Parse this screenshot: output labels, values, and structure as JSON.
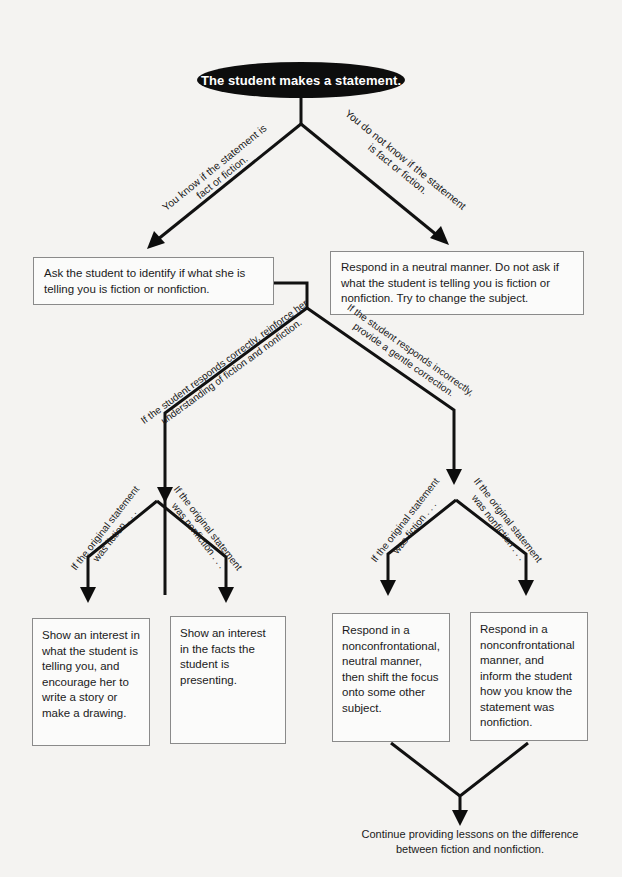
{
  "diagram": {
    "start": "The student makes a statement.",
    "branch_know": {
      "label_line1": "You know if the statement is",
      "label_line2": "fact or fiction."
    },
    "branch_not_know": {
      "label_line1": "You do not know if the statement",
      "label_line2": "is fact or fiction."
    },
    "box_ask": "Ask the student to identify if what she is telling you is fiction or nonfiction.",
    "box_neutral": "Respond in a neutral manner. Do not ask if what the student is telling you is fiction or nonfiction. Try to change the subject.",
    "branch_correct": {
      "label_line1": "If the student responds correctly, reinforce her",
      "label_line2": "understanding of fiction and nonfiction."
    },
    "branch_incorrect": {
      "label_line1": "If the student responds incorrectly,",
      "label_line2": "provide a gentle correction."
    },
    "correct_fiction": {
      "label_line1": "If the original statement",
      "label_line2": "was fiction . . ."
    },
    "correct_nonfiction": {
      "label_line1": "If the original statement",
      "label_line2": "was nonfiction . . ."
    },
    "incorrect_fiction": {
      "label_line1": "If the original statement",
      "label_line2": "was fiction . . ."
    },
    "incorrect_nonfiction": {
      "label_line1": "If the original statement",
      "label_line2": "was nonfiction . . ."
    },
    "box_story": "Show an interest in what the student is telling you, and encourage her to write a story or make a drawing.",
    "box_facts": "Show an interest in the facts the student is presenting.",
    "box_shift": "Respond in a nonconfrontational, neutral manner, then shift the focus onto some other subject.",
    "box_inform": "Respond in a nonconfrontational manner, and inform the student how you know the statement was nonfiction.",
    "end": "Continue providing lessons on the difference between fiction and nonfiction."
  },
  "colors": {
    "line": "#111111",
    "box_border": "#8a8a8a",
    "background": "#f4f3f1",
    "start_fill": "#0d0d0d"
  }
}
